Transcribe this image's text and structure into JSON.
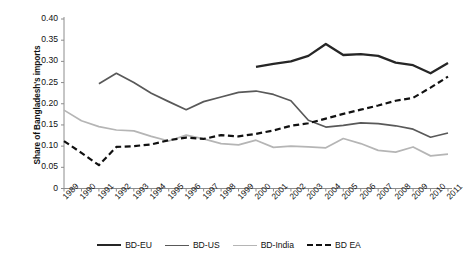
{
  "chart_data": {
    "type": "line",
    "title": "",
    "xlabel": "",
    "ylabel": "Share of Bangladesh's imports",
    "ylim": [
      0,
      0.4
    ],
    "ytick_labels": [
      "0.40",
      "0.35",
      "0.30",
      "0.25",
      "0.20",
      "0.15",
      "0.10",
      "0.05",
      "0"
    ],
    "ytick_values": [
      0.4,
      0.35,
      0.3,
      0.25,
      0.2,
      0.15,
      0.1,
      0.05,
      0
    ],
    "grid": false,
    "legend_position": "bottom",
    "x": [
      1989,
      1990,
      1991,
      1992,
      1993,
      1994,
      1995,
      1996,
      1997,
      1998,
      1999,
      2000,
      2001,
      2002,
      2003,
      2004,
      2005,
      2006,
      2007,
      2008,
      2009,
      2010,
      2011
    ],
    "categories": [
      "1989",
      "1990",
      "1991",
      "1992",
      "1993",
      "1994",
      "1995",
      "1996",
      "1997",
      "1998",
      "1999",
      "2000",
      "2001",
      "2002",
      "2003",
      "2004",
      "2005",
      "2006",
      "2007",
      "2008",
      "2009",
      "2010",
      "2011"
    ],
    "series": [
      {
        "name": "BD-EU",
        "color": "#262626",
        "width": 2.3,
        "dash": "solid",
        "values": [
          null,
          null,
          null,
          null,
          null,
          null,
          null,
          null,
          null,
          null,
          null,
          0.287,
          0.294,
          0.3,
          0.313,
          0.341,
          0.315,
          0.317,
          0.313,
          0.297,
          0.291,
          0.272,
          0.296
        ]
      },
      {
        "name": "BD-US",
        "color": "#595959",
        "width": 1.7,
        "dash": "solid",
        "values": [
          null,
          null,
          0.247,
          0.272,
          0.25,
          0.225,
          0.205,
          0.186,
          0.205,
          0.216,
          0.227,
          0.23,
          0.222,
          0.207,
          0.161,
          0.145,
          0.149,
          0.155,
          0.153,
          0.148,
          0.14,
          0.121,
          0.131
        ]
      },
      {
        "name": "BD-India",
        "color": "#b5b5b5",
        "width": 1.7,
        "dash": "solid",
        "values": [
          0.185,
          0.16,
          0.146,
          0.138,
          0.136,
          0.123,
          0.112,
          0.126,
          0.117,
          0.106,
          0.103,
          0.114,
          0.097,
          0.1,
          0.098,
          0.096,
          0.118,
          0.106,
          0.09,
          0.086,
          0.098,
          0.077,
          0.081
        ]
      },
      {
        "name": "BD EA",
        "color": "#111111",
        "width": 2.2,
        "dash": "dashed",
        "values": [
          0.112,
          0.084,
          0.055,
          0.098,
          0.1,
          0.104,
          0.114,
          0.12,
          0.117,
          0.126,
          0.123,
          0.129,
          0.137,
          0.148,
          0.154,
          0.165,
          0.176,
          0.186,
          0.196,
          0.207,
          0.214,
          0.238,
          0.264
        ]
      }
    ]
  },
  "legend": {
    "items": [
      {
        "label": "BD-EU",
        "color": "#262626",
        "dash": "solid",
        "width": 2.6
      },
      {
        "label": "BD-US",
        "color": "#595959",
        "dash": "solid",
        "width": 1.8
      },
      {
        "label": "BD-India",
        "color": "#b5b5b5",
        "dash": "solid",
        "width": 1.8
      },
      {
        "label": "BD EA",
        "color": "#111111",
        "dash": "dashed",
        "width": 2.6
      }
    ]
  }
}
